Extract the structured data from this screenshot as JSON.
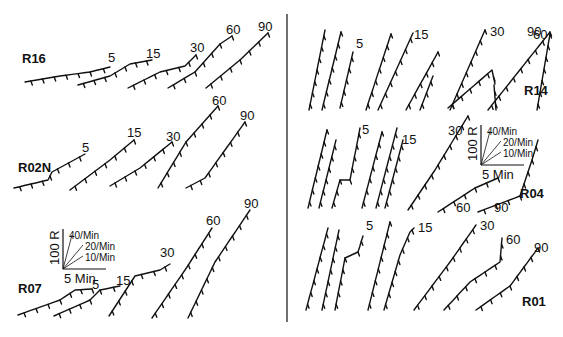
{
  "figure": {
    "divider": true,
    "left_panels": [
      {
        "name": "R16",
        "label": "R16",
        "label_pos": [
          22,
          63
        ],
        "records": [
          {
            "session_label": "5",
            "points": [
              [
                25,
                82
              ],
              [
                60,
                76
              ],
              [
                90,
                72
              ],
              [
                110,
                67
              ]
            ],
            "label_pos": [
              108,
              62
            ]
          },
          {
            "session_label": "15",
            "points": [
              [
                78,
                85
              ],
              [
                110,
                76
              ],
              [
                130,
                64
              ],
              [
                152,
                60
              ]
            ],
            "label_pos": [
              146,
              58
            ]
          },
          {
            "session_label": "30",
            "points": [
              [
                128,
                88
              ],
              [
                160,
                72
              ],
              [
                185,
                66
              ],
              [
                196,
                55
              ]
            ],
            "label_pos": [
              190,
              52
            ]
          },
          {
            "session_label": "60",
            "points": [
              [
                168,
                88
              ],
              [
                195,
                72
              ],
              [
                220,
                44
              ],
              [
                232,
                36
              ]
            ],
            "label_pos": [
              226,
              34
            ]
          },
          {
            "session_label": "90",
            "points": [
              [
                206,
                88
              ],
              [
                240,
                60
              ],
              [
                268,
                33
              ]
            ],
            "label_pos": [
              258,
              31
            ]
          }
        ]
      },
      {
        "name": "R02N",
        "label": "R02N",
        "label_pos": [
          18,
          172
        ],
        "records": [
          {
            "session_label": "5",
            "points": [
              [
                14,
                188
              ],
              [
                48,
                180
              ],
              [
                52,
                172
              ],
              [
                85,
                154
              ]
            ],
            "label_pos": [
              82,
              152
            ]
          },
          {
            "session_label": "15",
            "points": [
              [
                70,
                190
              ],
              [
                110,
                160
              ],
              [
                134,
                140
              ]
            ],
            "label_pos": [
              127,
              137
            ]
          },
          {
            "session_label": "30",
            "points": [
              [
                110,
                186
              ],
              [
                140,
                168
              ],
              [
                172,
                142
              ]
            ],
            "label_pos": [
              166,
              141
            ]
          },
          {
            "session_label": "60",
            "points": [
              [
                158,
                188
              ],
              [
                186,
                142
              ],
              [
                218,
                106
              ]
            ],
            "label_pos": [
              212,
              105
            ]
          },
          {
            "session_label": "90",
            "points": [
              [
                186,
                188
              ],
              [
                205,
                178
              ],
              [
                245,
                122
              ]
            ],
            "label_pos": [
              240,
              120
            ]
          }
        ]
      },
      {
        "name": "R07",
        "label": "R07",
        "label_pos": [
          18,
          293
        ],
        "records": [
          {
            "session_label": "5",
            "points": [
              [
                18,
                315
              ],
              [
                60,
                300
              ],
              [
                75,
                290
              ],
              [
                92,
                289
              ]
            ],
            "label_pos": [
              92,
              289
            ]
          },
          {
            "session_label": "15",
            "points": [
              [
                54,
                316
              ],
              [
                90,
                300
              ],
              [
                100,
                290
              ],
              [
                120,
                286
              ]
            ],
            "label_pos": [
              116,
              285
            ]
          },
          {
            "session_label": "30",
            "points": [
              [
                109,
                316
              ],
              [
                135,
                276
              ],
              [
                160,
                270
              ],
              [
                170,
                264
              ]
            ],
            "label_pos": [
              160,
              257
            ]
          },
          {
            "session_label": "60",
            "points": [
              [
                152,
                318
              ],
              [
                185,
                270
              ],
              [
                212,
                228
              ]
            ],
            "label_pos": [
              206,
              225
            ]
          },
          {
            "session_label": "90",
            "points": [
              [
                188,
                318
              ],
              [
                215,
                262
              ],
              [
                250,
                210
              ]
            ],
            "label_pos": [
              244,
              208
            ]
          }
        ]
      }
    ],
    "right_panels": [
      {
        "name": "R14",
        "label": "R14",
        "label_pos": [
          524,
          95
        ],
        "records": [
          {
            "session_label": "",
            "points": [
              [
                309,
                110
              ],
              [
                325,
                30
              ]
            ]
          },
          {
            "session_label": "",
            "points": [
              [
                322,
                110
              ],
              [
                341,
                32
              ]
            ]
          },
          {
            "session_label": "5",
            "points": [
              [
                340,
                108
              ],
              [
                353,
                52
              ]
            ],
            "label_pos": [
              356,
              48
            ]
          },
          {
            "session_label": "",
            "points": [
              [
                366,
                110
              ],
              [
                391,
                34
              ]
            ]
          },
          {
            "session_label": "15",
            "points": [
              [
                378,
                110
              ],
              [
                413,
                33
              ]
            ],
            "label_pos": [
              414,
              39
            ]
          },
          {
            "session_label": "",
            "points": [
              [
                406,
                110
              ],
              [
                438,
                52
              ]
            ]
          },
          {
            "session_label": "",
            "points": [
              [
                420,
                110
              ],
              [
                433,
                76
              ]
            ]
          },
          {
            "session_label": "30",
            "points": [
              [
                450,
                110
              ],
              [
                485,
                30
              ]
            ],
            "label_pos": [
              490,
              36
            ]
          },
          {
            "session_label": "60",
            "points": [
              [
                448,
                108
              ],
              [
                492,
                70
              ],
              [
                495,
                84
              ]
            ],
            "label_pos": [
              533,
              39
            ]
          },
          {
            "session_label": "",
            "points": [
              [
                496,
                110
              ],
              [
                494,
                85
              ]
            ]
          },
          {
            "session_label": "90",
            "points": [
              [
                488,
                110
              ],
              [
                550,
                32
              ]
            ],
            "label_pos": [
              527,
              36
            ]
          },
          {
            "session_label": "",
            "points": [
              [
                537,
                110
              ],
              [
                550,
                34
              ]
            ]
          }
        ]
      },
      {
        "name": "R04",
        "label": "R04",
        "label_pos": [
          520,
          198
        ],
        "records": [
          {
            "session_label": "",
            "points": [
              [
                308,
                208
              ],
              [
                327,
                130
              ]
            ]
          },
          {
            "session_label": "",
            "points": [
              [
                319,
                208
              ],
              [
                336,
                140
              ]
            ]
          },
          {
            "session_label": "5",
            "points": [
              [
                332,
                208
              ],
              [
                340,
                180
              ],
              [
                350,
                180
              ],
              [
                360,
                128
              ]
            ],
            "label_pos": [
              362,
              134
            ]
          },
          {
            "session_label": "",
            "points": [
              [
                362,
                208
              ],
              [
                382,
                132
              ]
            ]
          },
          {
            "session_label": "",
            "points": [
              [
                376,
                208
              ],
              [
                397,
                128
              ]
            ]
          },
          {
            "session_label": "15",
            "points": [
              [
                385,
                208
              ],
              [
                403,
                140
              ]
            ],
            "label_pos": [
              402,
              144
            ]
          },
          {
            "session_label": "30",
            "points": [
              [
                408,
                210
              ],
              [
                435,
                170
              ],
              [
                468,
                116
              ]
            ],
            "label_pos": [
              448,
              135
            ]
          },
          {
            "session_label": "60",
            "points": [
              [
                438,
                212
              ],
              [
                475,
                188
              ],
              [
                498,
                178
              ]
            ],
            "label_pos": [
              456,
              212
            ]
          },
          {
            "session_label": "90",
            "points": [
              [
                478,
                212
              ],
              [
                520,
                196
              ],
              [
                532,
                160
              ],
              [
                538,
                140
              ]
            ],
            "label_pos": [
              494,
              212
            ]
          }
        ]
      },
      {
        "name": "R01",
        "label": "R01",
        "label_pos": [
          522,
          306
        ],
        "records": [
          {
            "session_label": "",
            "points": [
              [
                306,
                310
              ],
              [
                328,
                228
              ]
            ]
          },
          {
            "session_label": "",
            "points": [
              [
                322,
                310
              ],
              [
                339,
                230
              ]
            ]
          },
          {
            "session_label": "5",
            "points": [
              [
                335,
                310
              ],
              [
                345,
                258
              ],
              [
                358,
                252
              ],
              [
                363,
                236
              ]
            ],
            "label_pos": [
              366,
              230
            ]
          },
          {
            "session_label": "",
            "points": [
              [
                368,
                310
              ],
              [
                390,
                222
              ]
            ]
          },
          {
            "session_label": "15",
            "points": [
              [
                384,
                310
              ],
              [
                400,
                255
              ],
              [
                410,
                232
              ],
              [
                414,
                228
              ]
            ],
            "label_pos": [
              418,
              232
            ]
          },
          {
            "session_label": "30",
            "points": [
              [
                414,
                310
              ],
              [
                450,
                262
              ],
              [
                476,
                225
              ]
            ],
            "label_pos": [
              480,
              230
            ]
          },
          {
            "session_label": "60",
            "points": [
              [
                444,
                310
              ],
              [
                470,
                282
              ],
              [
                500,
                262
              ],
              [
                502,
                238
              ]
            ],
            "label_pos": [
              506,
              244
            ]
          },
          {
            "session_label": "90",
            "points": [
              [
                476,
                310
              ],
              [
                510,
                286
              ],
              [
                538,
                248
              ]
            ],
            "label_pos": [
              534,
              252
            ]
          }
        ]
      }
    ],
    "scale_bars": [
      {
        "origin": [
          63,
          269
        ],
        "y_label": "100 R",
        "x_label": "5 Min",
        "rate_labels": [
          "40/Min",
          "20/Min",
          "10/Min"
        ]
      },
      {
        "origin": [
          481,
          165
        ],
        "y_label": "100 R",
        "x_label": "5 Min",
        "rate_labels": [
          "40/Min",
          "20/Min",
          "10/Min"
        ]
      }
    ]
  }
}
